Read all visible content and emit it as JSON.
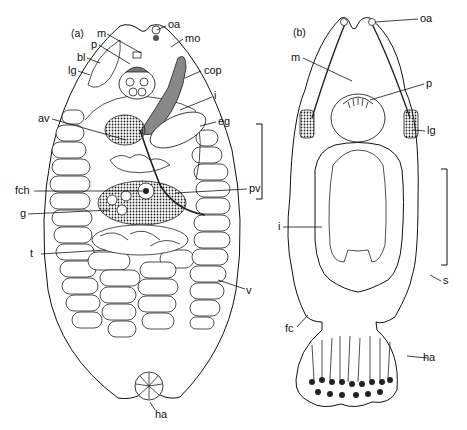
{
  "figure": {
    "panels": [
      {
        "id": "a",
        "label": "(a)",
        "labels": {
          "oa": "oa",
          "m": "m",
          "mo": "mo",
          "p": "p",
          "bl": "bl",
          "lg": "lg",
          "cop": "cop",
          "i": "i",
          "av": "av",
          "eg": "eg",
          "fch": "fch",
          "pv": "pv",
          "g": "g",
          "t": "t",
          "v": "v",
          "ha": "ha"
        }
      },
      {
        "id": "b",
        "label": "(b)",
        "labels": {
          "oa": "oa",
          "m": "m",
          "p": "p",
          "lg": "lg",
          "i": "i",
          "s": "s",
          "fc": "fc",
          "ha": "ha"
        }
      }
    ],
    "scale_bars": [
      {
        "panel": "a",
        "orientation": "vertical"
      },
      {
        "panel": "b",
        "orientation": "vertical"
      }
    ]
  }
}
